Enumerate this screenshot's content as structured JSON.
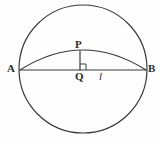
{
  "figure": {
    "kind": "geometry-diagram",
    "background_color": "#fefefe",
    "stroke_color": "#3a3a3a",
    "label_color": "#2b2b2b",
    "canvas": {
      "width": 163,
      "height": 146
    }
  },
  "circle": {
    "name": "main-circle",
    "center_x": 83,
    "center_y": 69,
    "radius": 64,
    "stroke_width": 1.2
  },
  "chord": {
    "name": "chord-AB",
    "x1": 20,
    "y1": 70,
    "x2": 146,
    "y2": 70,
    "stroke_width": 1.2
  },
  "arc": {
    "name": "arc-APB",
    "start_x": 20,
    "start_y": 70,
    "end_x": 146,
    "end_y": 70,
    "apex_x": 83,
    "apex_y": 50,
    "control_x": 83,
    "control_y": 30,
    "stroke_width": 1.2
  },
  "perpendicular": {
    "name": "segment-PQ",
    "x1": 80,
    "y1": 51,
    "x2": 80,
    "y2": 70,
    "stroke_width": 1.2
  },
  "right_angle_marker": {
    "name": "right-angle-at-Q",
    "x": 80,
    "y": 64,
    "size": 6,
    "stroke_width": 1.0
  },
  "labels": {
    "A": "A",
    "B": "B",
    "P": "P",
    "Q": "Q",
    "l": "l"
  }
}
